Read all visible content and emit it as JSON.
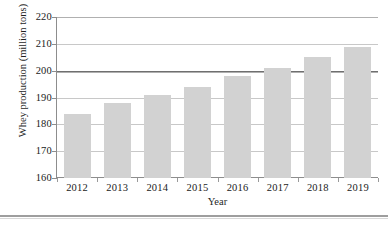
{
  "chart_data": {
    "type": "bar",
    "title": "",
    "xlabel": "Year",
    "ylabel": "Whey production (million tons)",
    "categories": [
      "2012",
      "2013",
      "2014",
      "2015",
      "2016",
      "2017",
      "2018",
      "2019"
    ],
    "values": [
      184,
      188,
      191,
      194,
      198,
      201,
      205,
      209
    ],
    "ylim": [
      160,
      220
    ],
    "yticks": [
      160,
      170,
      180,
      190,
      200,
      210,
      220
    ],
    "ytick_labels": [
      "160",
      "170",
      "180",
      "190",
      "200",
      "210",
      "220"
    ],
    "grid": true,
    "grid_axis": "y",
    "legend": null,
    "bar_color": "#d2d2d2",
    "gridline_color": "#c8c8c8",
    "emphasized_gridline": 200,
    "axis_color": "#8d8d8d"
  }
}
